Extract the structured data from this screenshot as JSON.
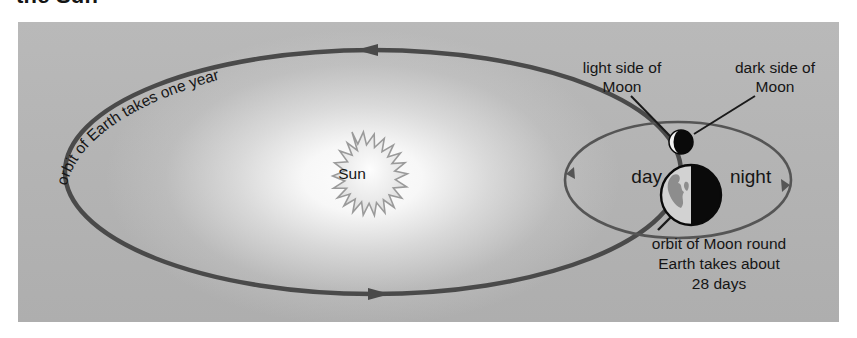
{
  "heading": "the Sun",
  "diagram": {
    "sun_label": "Sun",
    "earth_orbit_caption": "orbit of Earth takes one year",
    "light_side_label": "light side of\nMoon",
    "dark_side_label": "dark side of\nMoon",
    "day_label": "day",
    "night_label": "night",
    "moon_orbit_caption": "orbit of Moon round\nEarth takes about\n28 days"
  },
  "colors": {
    "panel_background": "#b4b4b4",
    "sun_glow": "#ffffff",
    "orbit_line": "#4a4a4a",
    "moon_orbit_line": "#555555",
    "earth_night": "#000000",
    "earth_day": "#cfcfcf",
    "text": "#151515",
    "page_background": "#ffffff"
  },
  "annotations": {
    "earth_orbit_direction": "counter-clockwise",
    "moon_orbit_direction": "counter-clockwise",
    "earth_orbit_arrow_top": "arrow-left",
    "earth_orbit_arrow_bottom": "arrow-right",
    "moon_orbit_arrow_left": "arrow-down",
    "moon_orbit_arrow_right": "arrow-up"
  }
}
